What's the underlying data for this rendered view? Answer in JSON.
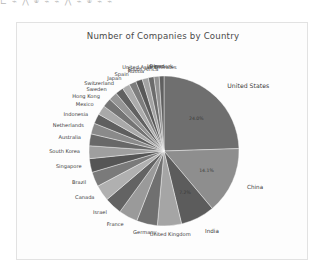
{
  "window": {
    "top_strip_text": "⊏ ⌁ ⋀ ⌾ ⌁ ⌁ ⋀ ⌁ ⌾ ⌁ ⌁"
  },
  "figure": {
    "title": "Number of Companies by Country",
    "background": "#fdfdfd",
    "border_color": "#e2e2e2"
  },
  "chart_data": {
    "type": "pie",
    "title": "Number of Companies by Country",
    "xlabel": "",
    "ylabel": "",
    "legend": "none",
    "labels_position": "outside-wedge",
    "autopct": "%1.1f%%",
    "startangle": 90,
    "categories": [
      "United States",
      "China",
      "India",
      "United Kingdom",
      "Germany",
      "France",
      "Israel",
      "Canada",
      "Brazil",
      "Singapore",
      "South Korea",
      "Australia",
      "Netherlands",
      "Indonesia",
      "Mexico",
      "Hong Kong",
      "Sweden",
      "Switzerland",
      "Japan",
      "Spain",
      "Russia",
      "South Africa",
      "United Arab Emirates",
      "Ireland",
      "Denmark"
    ],
    "values": [
      24.0,
      14.1,
      7.2,
      5.1,
      4.4,
      4.0,
      3.7,
      3.4,
      3.1,
      2.9,
      2.7,
      2.5,
      2.3,
      2.1,
      2.0,
      1.9,
      1.8,
      1.7,
      1.6,
      1.5,
      1.4,
      1.3,
      1.2,
      1.1,
      1.0
    ],
    "value_unit": "%",
    "visible_pct_labels": [
      {
        "category": "United States",
        "text": "24.0%"
      },
      {
        "category": "China",
        "text": "14.1%"
      },
      {
        "category": "India",
        "text": "7.2%"
      }
    ],
    "colors": [
      "#6f6f6f",
      "#8e8e8e",
      "#5c5c5c",
      "#a5a5a5",
      "#707070",
      "#9a9a9a",
      "#636363",
      "#b0b0b0",
      "#7a7a7a",
      "#555555",
      "#9f9f9f",
      "#686868",
      "#8a8a8a",
      "#5f5f5f",
      "#a9a9a9",
      "#747474",
      "#959595",
      "#616161",
      "#ababab",
      "#7d7d7d",
      "#585858",
      "#a2a2a2",
      "#6b6b6b",
      "#929292",
      "#606060"
    ],
    "grid": false
  }
}
